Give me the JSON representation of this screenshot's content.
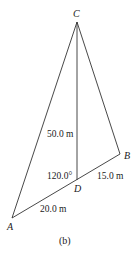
{
  "figure": {
    "caption": "(b)",
    "line_color": "#333333",
    "points": {
      "A": {
        "label": "A",
        "x": 12,
        "y": 218
      },
      "B": {
        "label": "B",
        "x": 120,
        "y": 154
      },
      "C": {
        "label": "C",
        "x": 77,
        "y": 22
      },
      "D": {
        "label": "D",
        "x": 77,
        "y": 180
      }
    },
    "segments": [
      {
        "from": "C",
        "to": "A"
      },
      {
        "from": "C",
        "to": "B"
      },
      {
        "from": "C",
        "to": "D"
      },
      {
        "from": "A",
        "to": "B"
      }
    ],
    "measurements": {
      "CD": "50.0 m",
      "DB": "15.0 m",
      "AD": "20.0 m",
      "angle_CDA": "120.0°"
    }
  }
}
